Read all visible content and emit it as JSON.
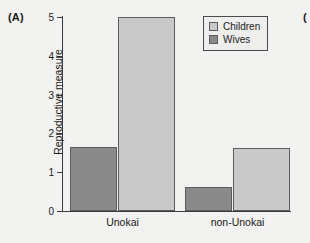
{
  "panel": {
    "label": "(A)",
    "next_label": "("
  },
  "legend": {
    "position": "top-right",
    "entries": [
      {
        "label": "Children",
        "swatch": "light-gray-swatch-icon",
        "color": "#c9c9c9"
      },
      {
        "label": "Wives",
        "swatch": "dark-gray-swatch-icon",
        "color": "#8a8a8a"
      }
    ]
  },
  "chart_data": {
    "type": "bar",
    "title": "",
    "xlabel": "",
    "ylabel": "Reproductive measure",
    "categories": [
      "Unokai",
      "non-Unokai"
    ],
    "series": [
      {
        "name": "Wives",
        "color": "#8a8a8a",
        "values": [
          1.65,
          0.63
        ]
      },
      {
        "name": "Children",
        "color": "#c9c9c9",
        "values": [
          5.0,
          1.63
        ]
      }
    ],
    "ylim": [
      0,
      5
    ],
    "yticks": [
      0,
      1,
      2,
      3,
      4,
      5
    ],
    "ytick_labels": [
      "0",
      "1",
      "2",
      "3",
      "4",
      "5"
    ],
    "grid": false
  }
}
